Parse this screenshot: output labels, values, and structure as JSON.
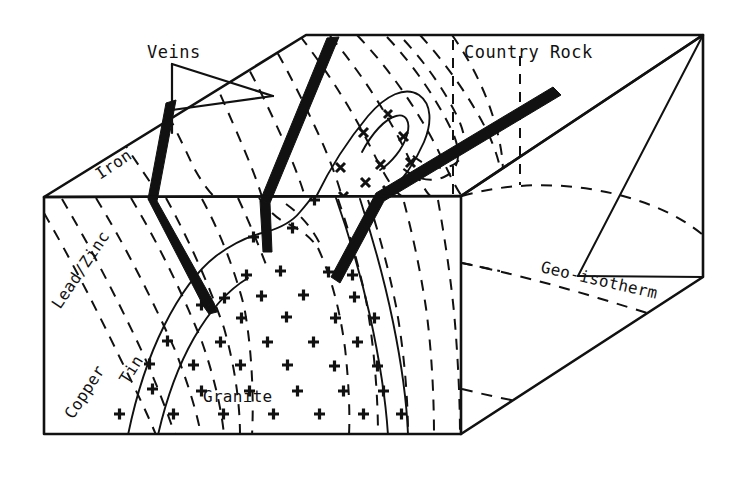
{
  "figure": {
    "kind": "3d-block-diagram",
    "background_color": "#ffffff",
    "ink_color": "#111111"
  },
  "labels": {
    "veins": "Veins",
    "country_rock": "Country Rock",
    "geo_isotherm": "Geo-isotherm",
    "iron": "Iron",
    "lead_zinc": "Lead/Zinc",
    "copper": "Copper",
    "tin": "Tin",
    "granite": "Granite"
  },
  "zones": [
    {
      "name": "Iron",
      "order": 1,
      "position": "outermost, top face"
    },
    {
      "name": "Lead/Zinc",
      "order": 2,
      "position": "front face, outer"
    },
    {
      "name": "Copper",
      "order": 3,
      "position": "front face, middle"
    },
    {
      "name": "Tin",
      "order": 4,
      "position": "front face, inner"
    },
    {
      "name": "Granite",
      "order": 5,
      "position": "core intrusion"
    }
  ],
  "features": {
    "vein_count": 3,
    "isotherm_style": "dashed",
    "granite_style": "solid outline with plus hatching",
    "granite_symbol": "+",
    "outcrop_symbol": "x"
  }
}
